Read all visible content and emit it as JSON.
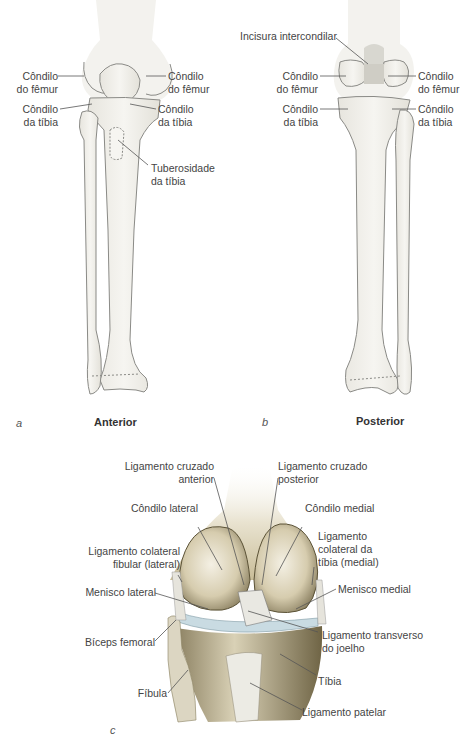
{
  "figure": {
    "panel_a": {
      "letter": "a",
      "title": "Anterior",
      "labels": {
        "condilo_femur_left": [
          "Côndilo",
          "do fêmur"
        ],
        "condilo_femur_right": [
          "Côndilo",
          "do fêmur"
        ],
        "condilo_tibia_left": [
          "Côndilo",
          "da tíbia"
        ],
        "condilo_tibia_right": [
          "Côndilo",
          "da tíbia"
        ],
        "tuberosidade": [
          "Tuberosidade",
          "da tíbia"
        ]
      }
    },
    "panel_b": {
      "letter": "b",
      "title": "Posterior",
      "labels": {
        "incisura": "Incisura intercondilar",
        "condilo_femur_left": [
          "Côndilo",
          "do fêmur"
        ],
        "condilo_femur_right": [
          "Côndilo",
          "do fêmur"
        ],
        "condilo_tibia_left": [
          "Côndilo",
          "da tíbia"
        ],
        "condilo_tibia_right": [
          "Côndilo",
          "da tíbia"
        ]
      }
    },
    "panel_c": {
      "letter": "c",
      "labels": {
        "lig_cruzado_anterior": [
          "Ligamento cruzado",
          "anterior"
        ],
        "lig_cruzado_posterior": [
          "Ligamento cruzado",
          "posterior"
        ],
        "condilo_lateral": "Côndilo lateral",
        "condilo_medial": "Côndilo medial",
        "lig_colateral_fibular": [
          "Ligamento colateral",
          "fibular (lateral)"
        ],
        "lig_colateral_tibia": [
          "Ligamento",
          "colateral da",
          "tíbia (medial)"
        ],
        "menisco_lateral": "Menisco lateral",
        "menisco_medial": "Menisco medial",
        "lig_transverso": [
          "Ligamento transverso",
          "do joelho"
        ],
        "biceps_femoral": "Bíceps femoral",
        "tibia": "Tíbia",
        "fibula": "Fíbula",
        "lig_patelar": "Ligamento patelar"
      }
    },
    "colors": {
      "bone_fill": "#efede6",
      "bone_stroke": "#8a8a86",
      "leader_line": "#555555",
      "knee_bone": "#d8cfb4",
      "knee_shadow": "#8a7d5a",
      "meniscus": "#c9dbe2"
    }
  }
}
